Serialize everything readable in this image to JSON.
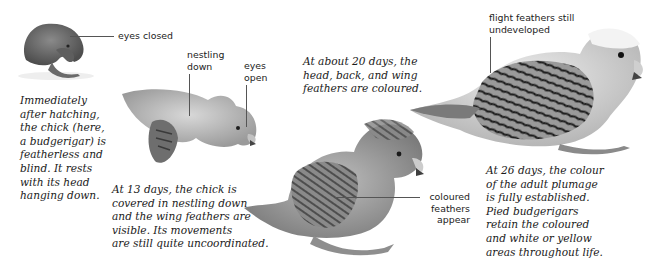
{
  "figure": {
    "stages": [
      {
        "id": "hatchling",
        "caption": "Immediately\nafter hatching,\nthe chick (here,\na budgerigar) is\nfeatherless and\nblind. It rests\nwith its head\nhanging down.",
        "labels": [
          {
            "text": "eyes closed"
          }
        ]
      },
      {
        "id": "day13",
        "caption": "At 13 days, the chick is\ncovered in nestling down\nand the wing feathers are\nvisible. Its movements\nare still quite uncoordinated.",
        "labels": [
          {
            "text": "nestling\ndown"
          },
          {
            "text": "eyes\nopen"
          }
        ]
      },
      {
        "id": "day20",
        "caption": "At about 20 days, the\nhead, back, and wing\nfeathers are coloured.",
        "labels": [
          {
            "text": "coloured\nfeathers\nappear"
          }
        ]
      },
      {
        "id": "day26",
        "caption": "At 26 days, the colour\nof the adult plumage\nis fully established.\nPied budgerigars\nretain the coloured\nand white or yellow\nareas throughout life.",
        "labels": [
          {
            "text": "flight feathers still\nundeveloped"
          }
        ]
      }
    ]
  }
}
